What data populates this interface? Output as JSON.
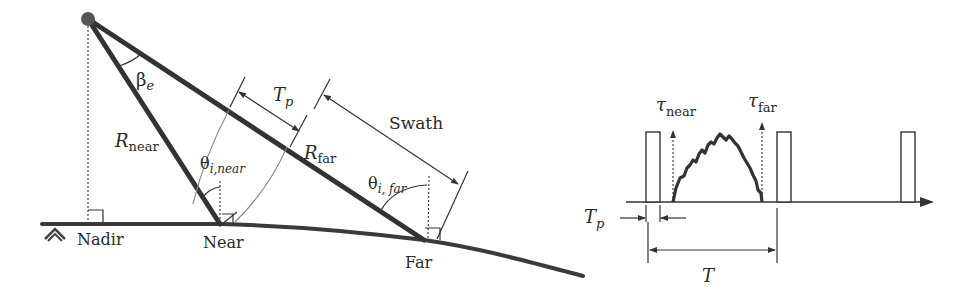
{
  "geometry": {
    "satellite": "satellite-dot",
    "beam_angle_label": "β",
    "beam_angle_sub": "e",
    "pulse_width_label": "T",
    "pulse_width_sub": "p",
    "swath_label": "Swath",
    "r_near_label": "R",
    "r_near_sub": "near",
    "r_far_label": "R",
    "r_far_sub": "far",
    "theta_near_label": "θ",
    "theta_near_sub": "i,near",
    "theta_far_label": "θ",
    "theta_far_sub": "i, far",
    "nadir_label": "Nadir",
    "near_label": "Near",
    "far_label": "Far"
  },
  "timing": {
    "tau_near_label": "τ",
    "tau_near_sub": "near",
    "tau_far_label": "τ",
    "tau_far_sub": "far",
    "pulse_width_label": "T",
    "pulse_width_sub": "p",
    "period_label": "T"
  }
}
